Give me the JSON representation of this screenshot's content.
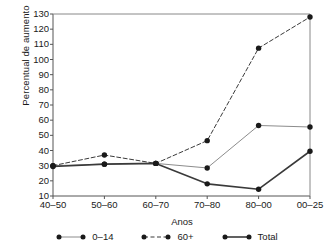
{
  "chart_data": {
    "type": "line",
    "title": "",
    "xlabel": "Anos",
    "ylabel": "Percentual de aumento",
    "categories": [
      "40–50",
      "50–60",
      "60–70",
      "70–80",
      "80–00",
      "00–25"
    ],
    "ylim": [
      10,
      130
    ],
    "yticks": [
      10,
      20,
      30,
      40,
      50,
      60,
      70,
      80,
      90,
      100,
      110,
      120,
      130
    ],
    "ytick_labels": [
      "10",
      "20",
      "30",
      "40",
      "50",
      "60",
      "70",
      "80",
      "90",
      "100",
      "110",
      "120",
      "130"
    ],
    "grid": false,
    "legend_position": "bottom",
    "series": [
      {
        "name": "0–14",
        "style": "solid-thin",
        "color": "#8c8c8c",
        "marker": "circle",
        "values": [
          30,
          31,
          31.5,
          28.5,
          56.5,
          55.5
        ]
      },
      {
        "name": "60+",
        "style": "dashed",
        "color": "#3a3a3a",
        "marker": "circle",
        "values": [
          30,
          37,
          31.5,
          46.5,
          107.5,
          128
        ]
      },
      {
        "name": "Total",
        "style": "solid-thick",
        "color": "#3a3a3a",
        "marker": "circle",
        "values": [
          29.5,
          31,
          31.5,
          18,
          14.5,
          39.5
        ]
      }
    ]
  },
  "axes": {
    "y_axis_label": "Percentual de aumento",
    "x_axis_label": "Anos"
  },
  "legend": {
    "items": [
      {
        "label": "0–14"
      },
      {
        "label": "60+"
      },
      {
        "label": "Total"
      }
    ]
  }
}
